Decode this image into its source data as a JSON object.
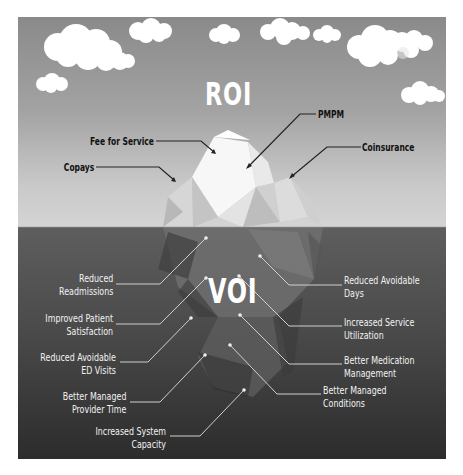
{
  "figure": {
    "above_water_title": "ROI",
    "below_water_title": "VOI",
    "colors": {
      "sky_top": "#8a8a8a",
      "sky_bottom": "#d4d4d4",
      "water_top": "#5e5e5e",
      "water_bottom": "#2c2c2c",
      "cloud": "#ffffff",
      "roi_label_text": "#111111",
      "voi_label_text": "#f2f2f2"
    },
    "roi_labels": [
      {
        "text": "PMPM"
      },
      {
        "text": "Fee for Service"
      },
      {
        "text": "Coinsurance"
      },
      {
        "text": "Copays"
      }
    ],
    "voi_labels_left": [
      {
        "line1": "Reduced",
        "line2": "Readmissions"
      },
      {
        "line1": "Improved Patient",
        "line2": "Satisfaction"
      },
      {
        "line1": "Reduced Avoidable",
        "line2": "ED Visits"
      },
      {
        "line1": "Better Managed",
        "line2": "Provider Time"
      },
      {
        "line1": "Increased System",
        "line2": "Capacity"
      }
    ],
    "voi_labels_right": [
      {
        "line1": "Reduced Avoidable",
        "line2": "Days"
      },
      {
        "line1": "Increased Service",
        "line2": "Utilization"
      },
      {
        "line1": "Better Medication",
        "line2": "Management"
      },
      {
        "line1": "Better Managed",
        "line2": "Conditions"
      }
    ],
    "icons": [
      "cloud-icon",
      "iceberg-illustration",
      "arrow-icon"
    ]
  }
}
